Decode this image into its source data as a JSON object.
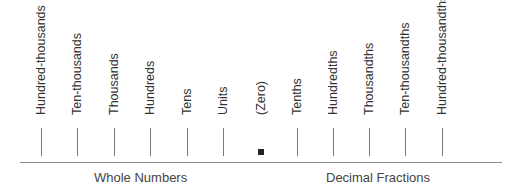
{
  "columns": [
    {
      "label": "Hundred-thousands",
      "x": 41,
      "marker": "tick"
    },
    {
      "label": "Ten-thousands",
      "x": 77,
      "marker": "tick"
    },
    {
      "label": "Thousands",
      "x": 114,
      "marker": "tick"
    },
    {
      "label": "Hundreds",
      "x": 150,
      "marker": "tick"
    },
    {
      "label": "Tens",
      "x": 187,
      "marker": "tick"
    },
    {
      "label": "Units",
      "x": 223,
      "marker": "tick"
    },
    {
      "label": "(Zero)",
      "x": 261,
      "marker": "square"
    },
    {
      "label": "Tenths",
      "x": 297,
      "marker": "tick"
    },
    {
      "label": "Hundredths",
      "x": 333,
      "marker": "tick"
    },
    {
      "label": "Thousandths",
      "x": 369,
      "marker": "tick"
    },
    {
      "label": "Ten-thousandths",
      "x": 405,
      "marker": "tick"
    },
    {
      "label": "Hundred-thousandths",
      "x": 442,
      "marker": "tick"
    }
  ],
  "groups": {
    "whole": "Whole Numbers",
    "decimal": "Decimal Fractions"
  }
}
